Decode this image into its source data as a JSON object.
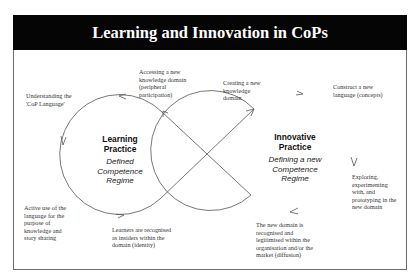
{
  "header": {
    "title": "Learning and Innovation in CoPs"
  },
  "left_cycle": {
    "title_line1": "Learning",
    "title_line2": "Practice",
    "sub_line1": "Defined",
    "sub_line2": "Competence",
    "sub_line3": "Regime"
  },
  "right_cycle": {
    "title_line1": "Innovative",
    "title_line2": "Practice",
    "sub_line1": "Defining a new",
    "sub_line2": "Competence",
    "sub_line3": "Regime"
  },
  "labels": {
    "understanding": [
      "Understanding the",
      "'CoP Language'"
    ],
    "accessing": [
      "Accessing a new",
      "knowledge domain",
      "(peripheral",
      "participation)"
    ],
    "active_use": [
      "Active use of the",
      "language for the",
      "purpose of",
      "knowledge and",
      "story sharing"
    ],
    "learners": [
      "Learners are recognised",
      "as insiders within the",
      "domain (identity)"
    ],
    "creating": [
      "Creating a new",
      "knowledge",
      "domain"
    ],
    "construct": [
      "Construct a new",
      "language (concepts)"
    ],
    "exploring": [
      "Exploring,",
      "experimenting",
      "with, and",
      "prototyping in the",
      "new domain"
    ],
    "new_domain": [
      "The new domain is",
      "recognised and",
      "legitimised within the",
      "organisation and/or the",
      "market (diffusion)"
    ]
  },
  "colors": {
    "header_bg": "#050505",
    "header_text": "#ffffff",
    "line": "#444444"
  }
}
